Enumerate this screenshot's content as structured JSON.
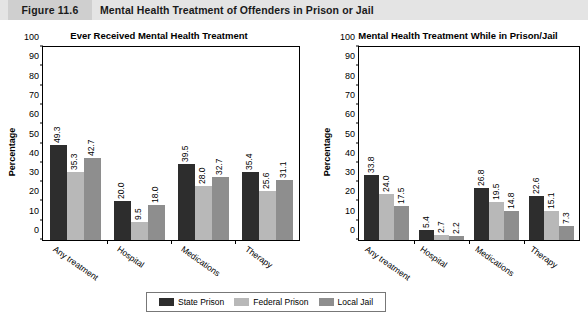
{
  "header": {
    "figure_number": "Figure 11.6",
    "title": "Mental Health Treatment of Offenders in Prison or Jail"
  },
  "legend": {
    "items": [
      {
        "label": "State Prison",
        "color": "#2d2d2d"
      },
      {
        "label": "Federal Prison",
        "color": "#b8b8b8"
      },
      {
        "label": "Local Jail",
        "color": "#8e8e8e"
      }
    ]
  },
  "chart_data": [
    {
      "type": "bar",
      "title": "Ever Received Mental Health Treatment",
      "xlabel": "",
      "ylabel": "Percentage",
      "ylim": [
        0,
        100
      ],
      "yticks": [
        0,
        10,
        20,
        30,
        40,
        50,
        60,
        70,
        80,
        90,
        100
      ],
      "grid": false,
      "legend_position": "bottom-center",
      "categories": [
        "Any treatment",
        "Hospital",
        "Medications",
        "Therapy"
      ],
      "series": [
        {
          "name": "State Prison",
          "color": "#2d2d2d",
          "values": [
            49.3,
            20.0,
            39.5,
            35.4
          ]
        },
        {
          "name": "Federal Prison",
          "color": "#b8b8b8",
          "values": [
            35.3,
            9.5,
            28.0,
            25.6
          ]
        },
        {
          "name": "Local Jail",
          "color": "#8e8e8e",
          "values": [
            42.7,
            18.0,
            32.7,
            31.1
          ]
        }
      ]
    },
    {
      "type": "bar",
      "title": "Mental Health Treatment While in Prison/Jail",
      "xlabel": "",
      "ylabel": "Percentage",
      "ylim": [
        0,
        100
      ],
      "yticks": [
        0,
        10,
        20,
        30,
        40,
        50,
        60,
        70,
        80,
        90,
        100
      ],
      "grid": false,
      "legend_position": "bottom-center",
      "categories": [
        "Any treatment",
        "Hospital",
        "Medications",
        "Therapy"
      ],
      "series": [
        {
          "name": "State Prison",
          "color": "#2d2d2d",
          "values": [
            33.8,
            5.4,
            26.8,
            22.6
          ]
        },
        {
          "name": "Federal Prison",
          "color": "#b8b8b8",
          "values": [
            24.0,
            2.7,
            19.5,
            15.1
          ]
        },
        {
          "name": "Local Jail",
          "color": "#8e8e8e",
          "values": [
            17.5,
            2.2,
            14.8,
            7.3
          ]
        }
      ]
    }
  ]
}
